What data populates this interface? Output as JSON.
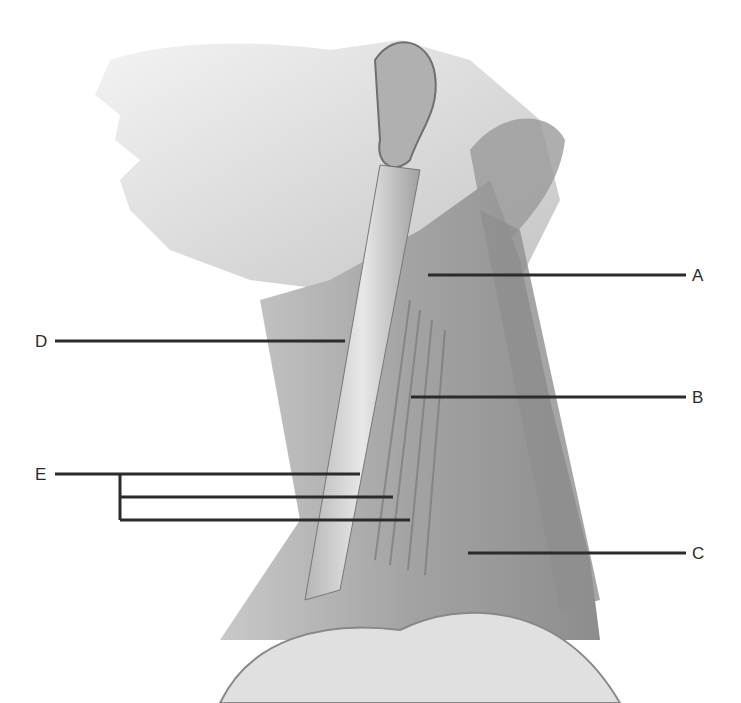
{
  "diagram": {
    "labels": [
      {
        "id": "A",
        "text": "A",
        "x": 692,
        "y": 267,
        "line": {
          "x1": 428,
          "y1": 275,
          "x2": 686,
          "y2": 275
        }
      },
      {
        "id": "B",
        "text": "B",
        "x": 692,
        "y": 389,
        "line": {
          "x1": 411,
          "y1": 397,
          "x2": 686,
          "y2": 397
        }
      },
      {
        "id": "C",
        "text": "C",
        "x": 692,
        "y": 545,
        "line": {
          "x1": 468,
          "y1": 553,
          "x2": 686,
          "y2": 553
        }
      },
      {
        "id": "D",
        "text": "D",
        "x": 35,
        "y": 333,
        "line": {
          "x1": 55,
          "y1": 341,
          "x2": 345,
          "y2": 341
        }
      },
      {
        "id": "E",
        "text": "E",
        "x": 35,
        "y": 466,
        "line": {
          "x1": 55,
          "y1": 474,
          "x2": 360,
          "y2": 474
        }
      }
    ],
    "e_branches": [
      {
        "x1": 120,
        "y1": 497,
        "x2": 393,
        "y2": 497
      },
      {
        "x1": 120,
        "y1": 520,
        "x2": 410,
        "y2": 520
      }
    ],
    "e_bracket": {
      "x": 120,
      "y1": 474,
      "y2": 520
    },
    "colors": {
      "line": "#2b2b2b",
      "skin_light": "#e6e6e6",
      "skin_mid": "#bdbdbd",
      "skin_dark": "#8a8a8a",
      "muscle": "#9e9e9e"
    }
  }
}
